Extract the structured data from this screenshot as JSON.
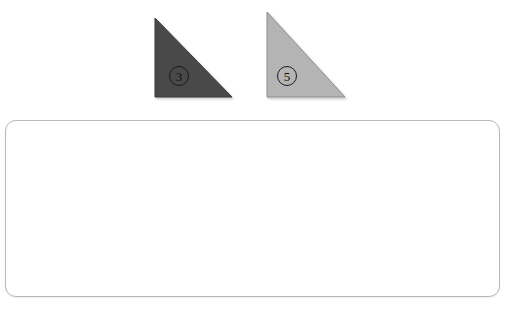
{
  "canvas": {
    "width": 513,
    "height": 311,
    "background_color": "#ffffff"
  },
  "shapes": [
    {
      "name": "triangle-3",
      "label": "③",
      "label_number": "3",
      "kind": "right-triangle",
      "fill_color": "#4a4a4a",
      "stroke_color": "#3a3a3a",
      "points": "155,18 155,97 232,97",
      "apex": {
        "x": 155,
        "y": 18
      },
      "right_angle": {
        "x": 155,
        "y": 97
      },
      "far_vertex": {
        "x": 232,
        "y": 97
      },
      "label_position": {
        "x": 179,
        "y": 76
      }
    },
    {
      "name": "triangle-5",
      "label": "⑤",
      "label_number": "5",
      "kind": "right-triangle",
      "fill_color": "#b4b4b4",
      "stroke_color": "#8e8e8e",
      "points": "267,12 267,97 345,97",
      "apex": {
        "x": 267,
        "y": 12
      },
      "right_angle": {
        "x": 267,
        "y": 97
      },
      "far_vertex": {
        "x": 345,
        "y": 97
      },
      "label_position": {
        "x": 287,
        "y": 76
      }
    }
  ],
  "panel": {
    "name": "answer-panel",
    "content": "",
    "x": 5,
    "y": 120,
    "width": 495,
    "height": 177,
    "corner_radius": 11,
    "border_color": "#b9b9b9",
    "fill_color": "#ffffff"
  }
}
